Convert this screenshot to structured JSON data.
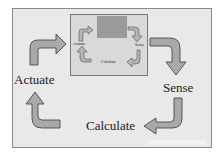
{
  "diagram": {
    "outer_cycle": {
      "actuate": "Actuate",
      "sense": "Sense",
      "calculate": "Calculate"
    },
    "inner_cycle": {
      "actuate": "Actuate",
      "sense": "Sense",
      "calculate": "Calculate"
    }
  },
  "colors": {
    "arrow_fill": "#a9a9a9",
    "arrow_stroke": "#3a3a3a",
    "background": "#e9e9e9"
  }
}
